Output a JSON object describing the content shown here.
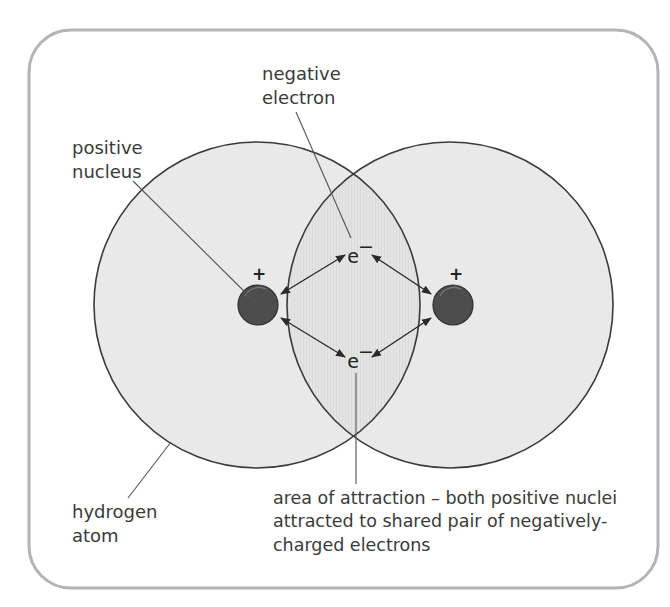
{
  "diagram": {
    "colors": {
      "frame": "#b4b4b4",
      "atom_fill": "#e9e9e9",
      "overlap_fill": "#e2e2e2",
      "outline": "#3a3a3a",
      "nucleus": "#4d4d4d",
      "leader": "#555555",
      "text": "#3a3a3a"
    },
    "labels": {
      "negative_electron": {
        "line1": "negative",
        "line2": "electron"
      },
      "positive_nucleus": {
        "line1": "positive",
        "line2": "nucleus"
      },
      "hydrogen_atom": {
        "line1": "hydrogen",
        "line2": "atom"
      },
      "area_of_attraction": {
        "line1": "area of attraction – both positive nuclei",
        "line2": "attracted to shared pair of negatively-",
        "line3": "charged electrons"
      }
    },
    "symbols": {
      "nucleus_charge": "+",
      "electron": "e",
      "electron_charge": "−"
    },
    "atoms": [
      {
        "name": "left-hydrogen-atom",
        "cx": 257,
        "cy": 305,
        "r": 163
      },
      {
        "name": "right-hydrogen-atom",
        "cx": 450,
        "cy": 305,
        "r": 163
      }
    ],
    "nuclei": [
      {
        "name": "left-nucleus",
        "cx": 258,
        "cy": 305,
        "r": 20
      },
      {
        "name": "right-nucleus",
        "cx": 453,
        "cy": 305,
        "r": 20
      }
    ],
    "electrons": [
      {
        "name": "top-shared-electron",
        "x": 358,
        "y": 262
      },
      {
        "name": "bottom-shared-electron",
        "x": 358,
        "y": 367
      }
    ]
  }
}
